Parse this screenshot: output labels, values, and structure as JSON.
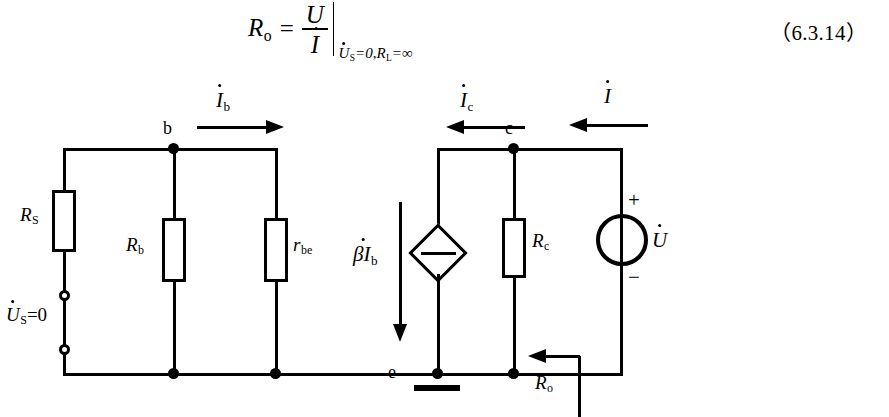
{
  "equation": {
    "lhs": "R",
    "lhs_sub": "o",
    "equals": "=",
    "numerator": "U",
    "denominator": "I",
    "condition": "=0,",
    "cond_var1": "U",
    "cond_var1_sub": "S",
    "cond_var2": "R",
    "cond_var2_sub": "L",
    "cond_tail": "=∞",
    "number": "（6.3.14）"
  },
  "circuit": {
    "components": {
      "rs": {
        "label": "R",
        "sub": "S"
      },
      "rb": {
        "label": "R",
        "sub": "b"
      },
      "rbe": {
        "label": "r",
        "sub": "be"
      },
      "rc": {
        "label": "R",
        "sub": "c"
      },
      "dependent_source": {
        "label": "βI",
        "sub": "b"
      },
      "voltage_source": {
        "label": "U",
        "plus": "+",
        "minus": "−"
      }
    },
    "nodes": {
      "b": "b",
      "c": "c",
      "e": "e"
    },
    "currents": {
      "ib": {
        "label": "I",
        "sub": "b"
      },
      "ic": {
        "label": "I",
        "sub": "c"
      },
      "i": {
        "label": "I",
        "sub": ""
      }
    },
    "source_label": {
      "text": "=0",
      "var": "U",
      "sub": "S"
    },
    "output_resistance": {
      "label": "R",
      "sub": "o"
    }
  }
}
